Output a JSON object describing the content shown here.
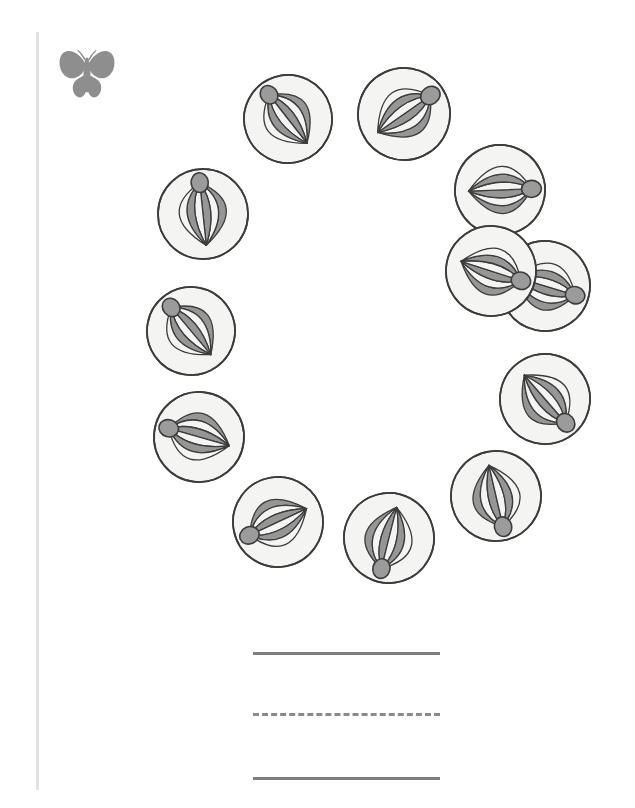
{
  "page": {
    "title": "Beach Ball Circle Tracing Worksheet",
    "background_color": "#ffffff",
    "width": 635,
    "height": 808
  },
  "decorations": {
    "margin_rule": {
      "name": "left-margin-rule",
      "color": "#e2e2e2",
      "x": 36,
      "y": 32,
      "width": 3,
      "height": 758
    },
    "butterfly": {
      "name": "butterfly-icon",
      "label": "butterfly",
      "color": "#8e8e8e",
      "x": 56,
      "y": 48,
      "width": 62,
      "height": 52
    }
  },
  "colors": {
    "ball_gray": "#969696",
    "ball_white": "#f4f4f2",
    "ball_outline": "#3c3c3c",
    "hub_gray": "#9b9b9b",
    "line_gray": "#7d7d7d",
    "dashed_gray": "#8a8a8a",
    "margin_gray": "#e2e2e2",
    "butterfly_gray": "#8e8e8e"
  },
  "illustration": {
    "name": "beach-ball-ring",
    "subject": "beach ball",
    "count": 12,
    "arrangement": "circle",
    "ring_center_x": 350,
    "ring_center_y": 320,
    "balls": [
      {
        "id": 1,
        "label": "beach-ball-1",
        "cx": 288,
        "cy": 119,
        "r": 44,
        "hub_angle": 110,
        "tilt": -18
      },
      {
        "id": 2,
        "label": "beach-ball-2",
        "cx": 404,
        "cy": 114,
        "r": 46,
        "hub_angle": 55,
        "tilt": 20
      },
      {
        "id": 3,
        "label": "beach-ball-3",
        "cx": 500,
        "cy": 190,
        "r": 45,
        "hub_angle": 20,
        "tilt": 18
      },
      {
        "id": 4,
        "label": "beach-ball-4",
        "cx": 545,
        "cy": 286,
        "r": 45,
        "hub_angle": 355,
        "tilt": 12
      },
      {
        "id": 5,
        "label": "beach-ball-5",
        "cx": 545,
        "cy": 399,
        "r": 45,
        "hub_angle": 325,
        "tilt": 14
      },
      {
        "id": 6,
        "label": "beach-ball-6",
        "cx": 496,
        "cy": 496,
        "r": 45,
        "hub_angle": 275,
        "tilt": -8
      },
      {
        "id": 7,
        "label": "beach-ball-7",
        "cx": 389,
        "cy": 538,
        "r": 45,
        "hub_angle": 240,
        "tilt": -16
      },
      {
        "id": 8,
        "label": "beach-ball-8",
        "cx": 278,
        "cy": 522,
        "r": 45,
        "hub_angle": 195,
        "tilt": -10
      },
      {
        "id": 9,
        "label": "beach-ball-9",
        "cx": 199,
        "cy": 437,
        "r": 45,
        "hub_angle": 170,
        "tilt": 6
      },
      {
        "id": 10,
        "label": "beach-ball-10",
        "cx": 191,
        "cy": 331,
        "r": 44,
        "hub_angle": 140,
        "tilt": 10
      },
      {
        "id": 11,
        "label": "beach-ball-11",
        "cx": 203,
        "cy": 214,
        "r": 45,
        "hub_angle": 98,
        "tilt": 2
      },
      {
        "id": 12,
        "label": "beach-ball-12",
        "cx": 491,
        "cy": 271,
        "r": 45,
        "hub_angle": 352,
        "tilt": 10
      }
    ]
  },
  "writing_lines": [
    {
      "name": "writing-line-top",
      "style": "solid",
      "x": 253,
      "y": 652,
      "width": 187
    },
    {
      "name": "writing-line-middle",
      "style": "dashed",
      "x": 253,
      "y": 713,
      "width": 187
    },
    {
      "name": "writing-line-bottom",
      "style": "solid",
      "x": 253,
      "y": 777,
      "width": 187
    }
  ]
}
